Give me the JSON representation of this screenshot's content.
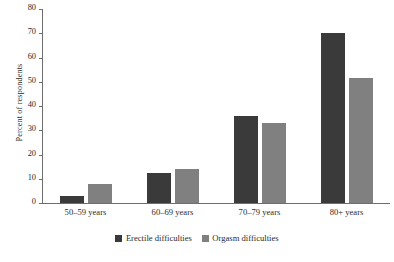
{
  "chart_data": {
    "type": "bar",
    "title": "",
    "xlabel": "",
    "ylabel": "Percent of respondents",
    "categories": [
      "50–59 years",
      "60–69 years",
      "70–79 years",
      "80+ years"
    ],
    "series": [
      {
        "name": "Erectile difficulties",
        "color": "#3a3a3a",
        "values": [
          3,
          12.5,
          36,
          70
        ]
      },
      {
        "name": "Orgasm difficulties",
        "color": "#808080",
        "values": [
          8,
          14,
          33,
          51.5
        ]
      }
    ],
    "ylim": [
      0,
      80
    ],
    "yticks": [
      0,
      10,
      20,
      30,
      40,
      50,
      60,
      70,
      80
    ],
    "ytick_labels": [
      "0",
      "10",
      "20",
      "30",
      "40",
      "50",
      "60",
      "70",
      "80"
    ],
    "grid": false,
    "legend_position": "bottom"
  },
  "legend": {
    "items": [
      {
        "label": "Erectile difficulties",
        "color": "#3a3a3a"
      },
      {
        "label": "Orgasm difficulties",
        "color": "#808080"
      }
    ]
  },
  "axis": {
    "y_axis_title": "Percent of respondents"
  }
}
